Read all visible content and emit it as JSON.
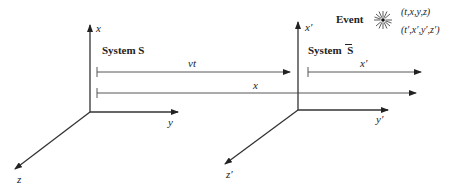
{
  "diagram": {
    "system_s": {
      "title": "System S",
      "axes": {
        "x": "x",
        "y": "y",
        "z": "z"
      }
    },
    "system_sbar": {
      "title_prefix": "System ",
      "title_symbol": "S",
      "axes": {
        "x": "x′",
        "y": "y′",
        "z": "z′"
      }
    },
    "displacements": {
      "vt_label": "vt",
      "x_label": "x",
      "xprime_label": "x′"
    },
    "event": {
      "label": "Event",
      "coords_s": "(t,x,y,z)",
      "coords_sbar": "(t′,x′,y′,z′)"
    },
    "colors": {
      "ink": "#333333",
      "background": "#ffffff"
    }
  }
}
